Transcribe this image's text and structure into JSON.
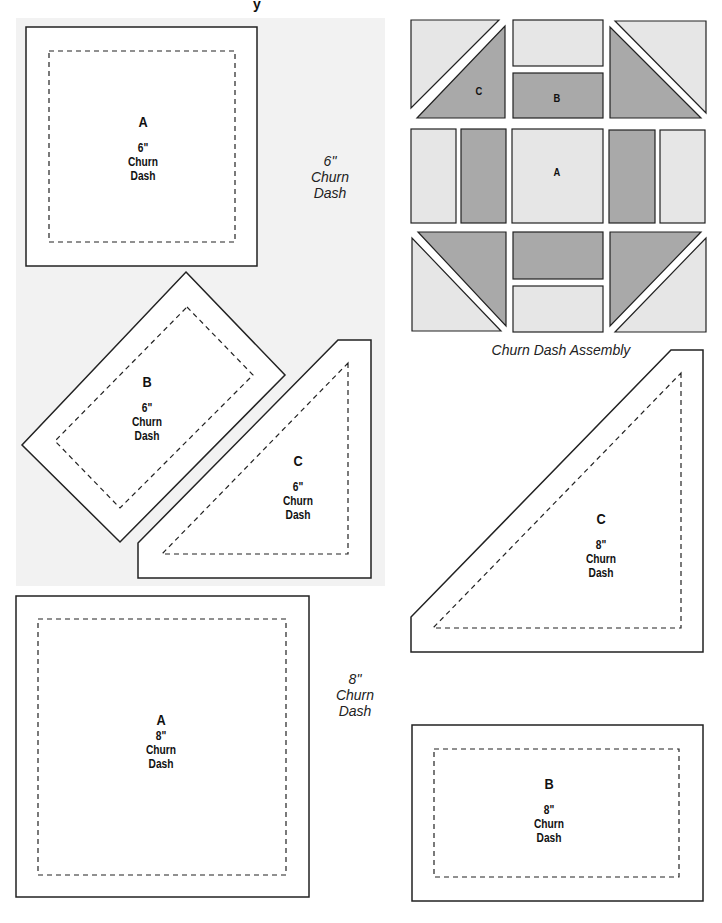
{
  "page": {
    "title_fragment": "y",
    "colors": {
      "panel_gray": "#f2f2f2",
      "fabric_light": "#e6e6e6",
      "fabric_dark": "#a9a9a9",
      "outline": "#222222",
      "piece_fill": "#ffffff"
    }
  },
  "six_inch": {
    "side_label": {
      "size": "6\"",
      "line1": "Churn",
      "line2": "Dash"
    },
    "pieces": [
      {
        "letter": "A",
        "size": "6\"",
        "line1": "Churn",
        "line2": "Dash"
      },
      {
        "letter": "B",
        "size": "6\"",
        "line1": "Churn",
        "line2": "Dash"
      },
      {
        "letter": "C",
        "size": "6\"",
        "line1": "Churn",
        "line2": "Dash"
      }
    ]
  },
  "eight_inch": {
    "side_label": {
      "size": "8\"",
      "line1": "Churn",
      "line2": "Dash"
    },
    "pieces": [
      {
        "letter": "A",
        "size": "8\"",
        "line1": "Churn",
        "line2": "Dash"
      },
      {
        "letter": "B",
        "size": "8\"",
        "line1": "Churn",
        "line2": "Dash"
      },
      {
        "letter": "C",
        "size": "8\"",
        "line1": "Churn",
        "line2": "Dash"
      }
    ]
  },
  "assembly": {
    "caption": "Churn Dash Assembly",
    "labels": {
      "a": "A",
      "b": "B",
      "c": "C"
    }
  }
}
